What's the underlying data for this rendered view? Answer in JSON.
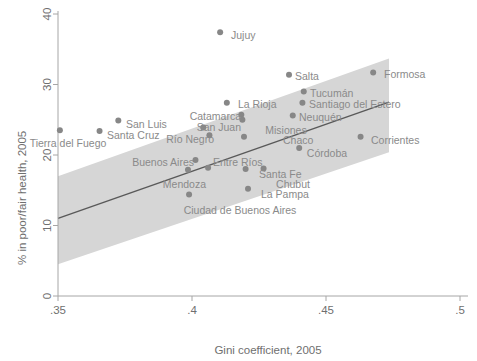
{
  "chart_data": {
    "type": "scatter",
    "title": "",
    "xlabel": "Gini coefficient, 2005",
    "ylabel": "% in poor/fair health, 2005",
    "xlim": [
      0.35,
      0.5
    ],
    "ylim": [
      0,
      40
    ],
    "xticks": [
      0.35,
      0.4,
      0.45,
      0.5
    ],
    "xticklabels": [
      ".35",
      ".4",
      ".45",
      ".5"
    ],
    "yticks": [
      0,
      10,
      20,
      30,
      40
    ],
    "yticklabels": [
      "0",
      "10",
      "20",
      "30",
      "40"
    ],
    "grid": false,
    "legend": "none",
    "marker_color": "#878787",
    "line_color": "#595959",
    "band_color": "#d6d6d6",
    "axis_color": "#a6a6a6",
    "points": [
      {
        "label": "Tierra del Fuego",
        "x": 0.3507,
        "y": 23.5,
        "lx": 68,
        "ly": 147,
        "anchor": "middle"
      },
      {
        "label": "Santa Cruz",
        "x": 0.3655,
        "y": 23.4,
        "lx": 107,
        "ly": 139,
        "anchor": "start"
      },
      {
        "label": "San Luis",
        "x": 0.3725,
        "y": 24.9,
        "lx": 126,
        "ly": 128,
        "anchor": "start"
      },
      {
        "label": "Jujuy",
        "x": 0.4105,
        "y": 37.4,
        "lx": 231,
        "ly": 39,
        "anchor": "start"
      },
      {
        "label": "La Rioja",
        "x": 0.413,
        "y": 27.4,
        "lx": 238,
        "ly": 108,
        "anchor": "start"
      },
      {
        "label": "Catamarca",
        "x": 0.4184,
        "y": 25.7,
        "lx": 241,
        "ly": 120,
        "anchor": "end"
      },
      {
        "label": "San Juan",
        "x": 0.4188,
        "y": 25.0,
        "lx": 241,
        "ly": 131,
        "anchor": "end"
      },
      {
        "label": "Salta",
        "x": 0.4362,
        "y": 31.4,
        "lx": 295,
        "ly": 80,
        "anchor": "start"
      },
      {
        "label": "Tucumán",
        "x": 0.4417,
        "y": 29.0,
        "lx": 310,
        "ly": 97,
        "anchor": "start"
      },
      {
        "label": "Santiago del Estero",
        "x": 0.4412,
        "y": 27.4,
        "lx": 309,
        "ly": 108,
        "anchor": "start"
      },
      {
        "label": "Neuquén",
        "x": 0.4376,
        "y": 25.6,
        "lx": 299,
        "ly": 121,
        "anchor": "start"
      },
      {
        "label": "Formosa",
        "x": 0.4676,
        "y": 31.7,
        "lx": 384,
        "ly": 78,
        "anchor": "start"
      },
      {
        "label": "Corrientes",
        "x": 0.4629,
        "y": 22.6,
        "lx": 371,
        "ly": 144,
        "anchor": "start"
      },
      {
        "label": "Misiones",
        "x": 0.4042,
        "y": 23.9,
        "lx": 286,
        "ly": 134,
        "anchor": "middle"
      },
      {
        "label": "Chaco",
        "x": 0.4194,
        "y": 22.6,
        "lx": 283,
        "ly": 144,
        "anchor": "start"
      },
      {
        "label": "Río Negro",
        "x": 0.4065,
        "y": 22.8,
        "lx": 214,
        "ly": 143,
        "anchor": "end"
      },
      {
        "label": "Córdoba",
        "x": 0.44,
        "y": 21.0,
        "lx": 327,
        "ly": 157,
        "anchor": "middle"
      },
      {
        "label": "Buenos Aires",
        "x": 0.4013,
        "y": 19.3,
        "lx": 194,
        "ly": 166,
        "anchor": "end"
      },
      {
        "label": "Entre Ríos",
        "x": 0.406,
        "y": 18.2,
        "lx": 213,
        "ly": 166,
        "anchor": "start"
      },
      {
        "label": "Mendoza",
        "x": 0.3985,
        "y": 17.9,
        "lx": 206,
        "ly": 188,
        "anchor": "end"
      },
      {
        "label": "Santa Fe",
        "x": 0.42,
        "y": 18.0,
        "lx": 259,
        "ly": 178,
        "anchor": "start"
      },
      {
        "label": "Chubut",
        "x": 0.4267,
        "y": 18.1,
        "lx": 293,
        "ly": 188,
        "anchor": "middle"
      },
      {
        "label": "La Pampa",
        "x": 0.4209,
        "y": 15.2,
        "lx": 261,
        "ly": 198,
        "anchor": "start"
      },
      {
        "label": "Ciudad de Buenos Aires",
        "x": 0.3989,
        "y": 14.4,
        "lx": 240,
        "ly": 214,
        "anchor": "middle"
      }
    ],
    "fit_line": {
      "x0": 0.35,
      "y0": 11.0,
      "x1": 0.4735,
      "y1": 27.5
    },
    "ci_band": {
      "x0": 0.35,
      "upper0": 17.0,
      "lower0": 4.5,
      "x1": 0.4735,
      "upper1": 33.7,
      "lower1": 20.4
    }
  }
}
